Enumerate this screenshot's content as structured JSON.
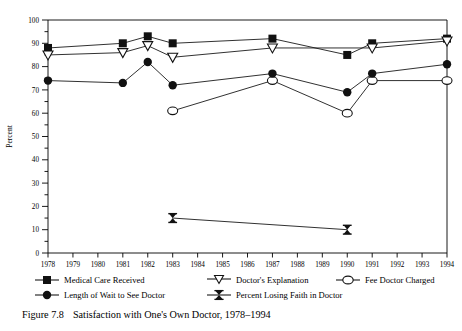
{
  "figure": {
    "caption_number": "Figure 7.8",
    "caption_text": "Satisfaction with One's Own Doctor, 1978–1994"
  },
  "chart_data": {
    "type": "line",
    "title": "",
    "xlabel": "",
    "ylabel": "Percent",
    "xlim": [
      1978,
      1994
    ],
    "ylim": [
      0,
      100
    ],
    "ytick_step": 10,
    "yminor_step": 5,
    "grid": false,
    "legend_position": "below-plot",
    "categories": [
      1978,
      1979,
      1980,
      1981,
      1982,
      1983,
      1984,
      1985,
      1986,
      1987,
      1988,
      1989,
      1990,
      1991,
      1992,
      1993,
      1994
    ],
    "xtick_labels": [
      "1978",
      "1979",
      "1980",
      "1981",
      "1982",
      "1983",
      "1984",
      "1985",
      "1986",
      "1987",
      "1988",
      "1989",
      "1990",
      "1991",
      "1992",
      "1993",
      "1994"
    ],
    "ytick_labels": [
      "0",
      "10",
      "20",
      "30",
      "40",
      "50",
      "60",
      "70",
      "80",
      "90",
      "100"
    ],
    "series": [
      {
        "name": "Medical Care Received",
        "marker": "filled-square",
        "points": [
          {
            "x": 1978,
            "y": 88
          },
          {
            "x": 1981,
            "y": 90
          },
          {
            "x": 1982,
            "y": 93
          },
          {
            "x": 1983,
            "y": 90
          },
          {
            "x": 1987,
            "y": 92
          },
          {
            "x": 1990,
            "y": 85
          },
          {
            "x": 1991,
            "y": 90
          },
          {
            "x": 1994,
            "y": 92
          }
        ]
      },
      {
        "name": "Doctor's Explanation",
        "marker": "open-triangle-down",
        "points": [
          {
            "x": 1978,
            "y": 85
          },
          {
            "x": 1981,
            "y": 86
          },
          {
            "x": 1982,
            "y": 89
          },
          {
            "x": 1983,
            "y": 84
          },
          {
            "x": 1987,
            "y": 88
          },
          {
            "x": 1991,
            "y": 88
          },
          {
            "x": 1994,
            "y": 91
          }
        ]
      },
      {
        "name": "Fee Doctor Charged",
        "marker": "open-circle",
        "points": [
          {
            "x": 1983,
            "y": 61
          },
          {
            "x": 1987,
            "y": 74
          },
          {
            "x": 1990,
            "y": 60
          },
          {
            "x": 1991,
            "y": 74
          },
          {
            "x": 1994,
            "y": 74
          }
        ]
      },
      {
        "name": "Length of Wait to See Doctor",
        "marker": "filled-circle",
        "points": [
          {
            "x": 1978,
            "y": 74
          },
          {
            "x": 1981,
            "y": 73
          },
          {
            "x": 1982,
            "y": 82
          },
          {
            "x": 1983,
            "y": 72
          },
          {
            "x": 1987,
            "y": 77
          },
          {
            "x": 1990,
            "y": 69
          },
          {
            "x": 1991,
            "y": 77
          },
          {
            "x": 1994,
            "y": 81
          }
        ]
      },
      {
        "name": "Percent Losing Faith in Doctor",
        "marker": "filled-bowtie",
        "points": [
          {
            "x": 1983,
            "y": 15
          },
          {
            "x": 1990,
            "y": 10
          }
        ]
      }
    ]
  },
  "legend": {
    "entries": [
      {
        "label": "Medical Care Received",
        "marker": "filled-square"
      },
      {
        "label": "Doctor's Explanation",
        "marker": "open-triangle-down"
      },
      {
        "label": "Fee Doctor Charged",
        "marker": "open-circle"
      },
      {
        "label": "Length of Wait to See Doctor",
        "marker": "filled-circle"
      },
      {
        "label": "Percent Losing Faith in Doctor",
        "marker": "filled-bowtie"
      }
    ]
  },
  "colors": {
    "line": "#1a1a1a",
    "axis": "#000000",
    "background": "#ffffff"
  }
}
